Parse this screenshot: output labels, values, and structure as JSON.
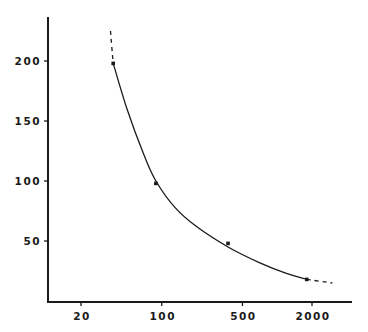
{
  "chart_data": {
    "type": "line",
    "title": "",
    "xlabel": "",
    "ylabel": "",
    "x_scale": "log",
    "xlim": [
      13,
      4000
    ],
    "ylim": [
      0,
      235
    ],
    "grid": false,
    "legend": null,
    "x_ticks": [
      20,
      100,
      500,
      2000
    ],
    "x_tick_labels": [
      "20",
      "100",
      "500",
      "2000"
    ],
    "y_ticks": [
      50,
      100,
      150,
      200
    ],
    "y_tick_labels": [
      "50",
      "100",
      "150",
      "200"
    ],
    "series": [
      {
        "name": "observed points",
        "kind": "scatter",
        "x": [
          38,
          89,
          375,
          1800
        ],
        "y": [
          198,
          98,
          48,
          18
        ]
      },
      {
        "name": "fitted curve",
        "kind": "line",
        "style": "solid",
        "x": [
          38,
          50,
          70,
          89,
          130,
          200,
          375,
          700,
          1200,
          1800
        ],
        "y": [
          198,
          160,
          122,
          100,
          78,
          62,
          45,
          32,
          23,
          18
        ]
      },
      {
        "name": "extrapolation (low)",
        "kind": "line",
        "style": "dashed",
        "x": [
          36,
          38
        ],
        "y": [
          225,
          198
        ]
      },
      {
        "name": "extrapolation (high)",
        "kind": "line",
        "style": "dashed",
        "x": [
          1800,
          3000
        ],
        "y": [
          18,
          15
        ]
      }
    ]
  },
  "colors": {
    "ink": "#1a1a1a",
    "background": "#ffffff"
  }
}
